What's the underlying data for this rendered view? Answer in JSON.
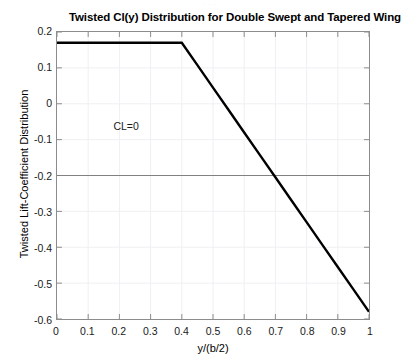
{
  "figure": {
    "top_remnant_text": "· · ·",
    "background_color": "#ffffff",
    "axis_color": "#8c8c8c",
    "grid_color": "#f0f0f4",
    "curve_color": "#000000",
    "reference_line_color": "#808080"
  },
  "chart_data": {
    "type": "line",
    "title": "Twisted Cl(y) Distribution for Double Swept and Tapered Wing",
    "xlabel": "y/(b/2)",
    "ylabel": "Twisted Lift-Coefficient Distribution",
    "xlim": [
      0,
      1
    ],
    "ylim": [
      -0.6,
      0.2
    ],
    "grid": true,
    "legend": null,
    "x_ticks": [
      0,
      0.1,
      0.2,
      0.3,
      0.4,
      0.5,
      0.6,
      0.7,
      0.8,
      0.9,
      1
    ],
    "x_tick_labels": [
      "0",
      "0.1",
      "0.2",
      "0.3",
      "0.4",
      "0.5",
      "0.6",
      "0.7",
      "0.8",
      "0.9",
      "1"
    ],
    "y_ticks": [
      0.2,
      0.1,
      0,
      -0.1,
      -0.2,
      -0.3,
      -0.4,
      -0.5,
      -0.6
    ],
    "y_tick_labels": [
      "0.2",
      "0.1",
      "0",
      "-0.1",
      "-0.2",
      "-0.3",
      "-0.4",
      "-0.5",
      "-0.6"
    ],
    "series": [
      {
        "name": "Twisted Cl(y)",
        "color": "#000000",
        "line_width": 2.4,
        "x": [
          0,
          0.05,
          0.1,
          0.15,
          0.2,
          0.25,
          0.3,
          0.35,
          0.4,
          0.45,
          0.5,
          0.55,
          0.6,
          0.65,
          0.7,
          0.75,
          0.8,
          0.85,
          0.9,
          0.95,
          1
        ],
        "values": [
          0.17,
          0.17,
          0.17,
          0.17,
          0.17,
          0.17,
          0.17,
          0.17,
          0.17,
          0.1075,
          0.045,
          -0.0175,
          -0.08,
          -0.1425,
          -0.205,
          -0.2675,
          -0.33,
          -0.3925,
          -0.455,
          -0.5175,
          -0.58
        ]
      },
      {
        "name": "CL=0 reference",
        "color": "#808080",
        "line_width": 1,
        "x": [
          0,
          1
        ],
        "values": [
          -0.2,
          -0.2
        ]
      }
    ],
    "annotations": [
      {
        "text": "CL=0",
        "x": 0.22,
        "y": -0.06
      }
    ]
  }
}
